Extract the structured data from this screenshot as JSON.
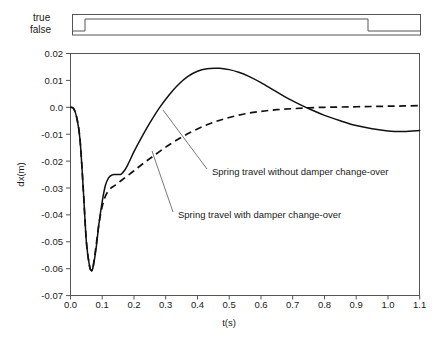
{
  "chart_data": {
    "type": "line",
    "title": "",
    "xlabel": "t(s)",
    "ylabel": "dx(m)",
    "xlim": [
      0.0,
      1.1
    ],
    "ylim": [
      -0.07,
      0.02
    ],
    "grid": false,
    "legend_position": "inline-annotations",
    "xticks": [
      "0.0",
      "0.1",
      "0.2",
      "0.3",
      "0.4",
      "0.5",
      "0.6",
      "0.7",
      "0.8",
      "0.9",
      "1.0",
      "1.1"
    ],
    "yticks": [
      "0.02",
      "0.01",
      "0.0",
      "-0.01",
      "-0.02",
      "-0.03",
      "-0.04",
      "-0.05",
      "-0.06",
      "-0.07"
    ],
    "series": [
      {
        "name": "Spring travel without damper change-over",
        "style": "solid",
        "color": "#111111",
        "x": [
          0.0,
          0.01,
          0.02,
          0.03,
          0.04,
          0.05,
          0.06,
          0.065,
          0.07,
          0.08,
          0.09,
          0.1,
          0.11,
          0.12,
          0.13,
          0.14,
          0.15,
          0.16,
          0.17,
          0.18,
          0.2,
          0.22,
          0.25,
          0.28,
          0.31,
          0.34,
          0.37,
          0.4,
          0.43,
          0.46,
          0.47,
          0.5,
          0.53,
          0.56,
          0.6,
          0.64,
          0.68,
          0.72,
          0.76,
          0.8,
          0.85,
          0.9,
          0.95,
          1.0,
          1.05,
          1.1
        ],
        "y": [
          0.0,
          -0.0005,
          -0.004,
          -0.012,
          -0.03,
          -0.05,
          -0.059,
          -0.0605,
          -0.06,
          -0.053,
          -0.043,
          -0.035,
          -0.029,
          -0.0262,
          -0.0252,
          -0.025,
          -0.025,
          -0.0248,
          -0.0235,
          -0.0215,
          -0.0165,
          -0.012,
          -0.0058,
          -0.0002,
          0.0045,
          0.0085,
          0.0115,
          0.0134,
          0.0143,
          0.0145,
          0.0145,
          0.014,
          0.013,
          0.0116,
          0.0092,
          0.0064,
          0.0036,
          0.0012,
          -0.001,
          -0.003,
          -0.005,
          -0.0068,
          -0.008,
          -0.0088,
          -0.009,
          -0.0086
        ]
      },
      {
        "name": "Spring travel with damper change-over",
        "style": "dashed",
        "color": "#111111",
        "x": [
          0.0,
          0.01,
          0.02,
          0.03,
          0.04,
          0.05,
          0.06,
          0.065,
          0.07,
          0.08,
          0.09,
          0.1,
          0.11,
          0.12,
          0.13,
          0.14,
          0.16,
          0.18,
          0.2,
          0.23,
          0.26,
          0.3,
          0.34,
          0.38,
          0.42,
          0.46,
          0.5,
          0.55,
          0.6,
          0.65,
          0.7,
          0.75,
          0.8,
          0.85,
          0.9,
          0.95,
          1.0,
          1.05,
          1.1
        ],
        "y": [
          0.0,
          -0.0005,
          -0.004,
          -0.012,
          -0.03,
          -0.05,
          -0.059,
          -0.0605,
          -0.06,
          -0.052,
          -0.043,
          -0.0368,
          -0.033,
          -0.031,
          -0.0298,
          -0.029,
          -0.0272,
          -0.0254,
          -0.0236,
          -0.0208,
          -0.0182,
          -0.0148,
          -0.0118,
          -0.0092,
          -0.007,
          -0.0052,
          -0.0038,
          -0.0024,
          -0.0015,
          -0.0009,
          -0.0005,
          -0.0002,
          0.0,
          0.0001,
          0.0002,
          0.0003,
          0.0004,
          0.0005,
          0.0006
        ]
      }
    ],
    "annotations": [
      {
        "text": "Spring travel without damper change-over",
        "text_x": 212,
        "text_y": 175,
        "leader_from_x": 163,
        "leader_from_y": 110,
        "leader_to_x": 207,
        "leader_to_y": 169
      },
      {
        "text": "Spring travel with damper change-over",
        "text_x": 178,
        "text_y": 218,
        "leader_from_x": 152,
        "leader_from_y": 151,
        "leader_to_x": 173,
        "leader_to_y": 212
      }
    ],
    "signal_panel": {
      "true_label": "true",
      "false_label": "false",
      "description": "damper change-over boolean signal",
      "transitions": [
        {
          "t": 0.0,
          "state": "false"
        },
        {
          "t": 0.042,
          "state": "true"
        },
        {
          "t": 0.935,
          "state": "false"
        }
      ]
    }
  }
}
